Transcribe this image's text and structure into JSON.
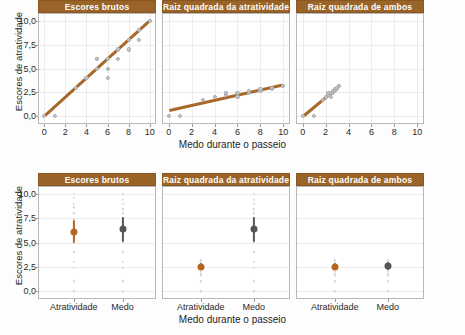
{
  "figure": {
    "y_axis_title": "Escores de atratividade",
    "x_axis_title_top": "Medo durante o passeio",
    "x_axis_title_bottom": "Medo durante o passeio",
    "strip_color": "#9a6328",
    "strip_text_color": "#ffffff",
    "fit_line_color": "#a8682a",
    "point_color": "#c9c9c9",
    "mean_attractiveness_color": "#b5651d",
    "mean_fear_color": "#555555"
  },
  "chart_data": [
    {
      "type": "scatter",
      "panel_index": 0,
      "row": "top",
      "title": "Escores brutos",
      "xlabel": "Medo durante o passeio",
      "ylabel": "Escores de atratividade",
      "xlim": [
        -0.5,
        10.5
      ],
      "ylim": [
        -0.7,
        10.7
      ],
      "xticks": [
        0,
        2,
        4,
        6,
        8,
        10
      ],
      "xticklabels": [
        "0",
        "2",
        "4",
        "6",
        "8",
        "10"
      ],
      "yticks": [
        0,
        2.5,
        5,
        7.5,
        10
      ],
      "yticklabels": [
        "0,0",
        "2,5",
        "5,0",
        "7,5",
        "10,0"
      ],
      "grid": true,
      "x": [
        0,
        1,
        3,
        4,
        5,
        5,
        5,
        6,
        6,
        6,
        6,
        7,
        7,
        7,
        8,
        8,
        8,
        9,
        9,
        9,
        10,
        10
      ],
      "y": [
        0,
        0,
        3,
        4,
        5,
        6,
        6,
        4,
        5,
        6,
        6,
        6,
        7,
        7,
        7,
        8,
        8,
        8,
        9,
        9,
        10,
        10
      ],
      "fit_line": {
        "x0": 0,
        "y0": 0,
        "x1": 10,
        "y1": 10
      }
    },
    {
      "type": "scatter",
      "panel_index": 1,
      "row": "top",
      "title": "Raiz quadrada da atratividade",
      "xlabel": "Medo durante o passeio",
      "ylabel": "Escores de atratividade",
      "xlim": [
        -0.5,
        10.5
      ],
      "ylim": [
        -0.7,
        10.7
      ],
      "xticks": [
        0,
        2,
        4,
        6,
        8,
        10
      ],
      "xticklabels": [
        "0",
        "2",
        "4",
        "6",
        "8",
        "10"
      ],
      "grid": true,
      "x": [
        0,
        1,
        3,
        4,
        5,
        5,
        5,
        6,
        6,
        7,
        7,
        8,
        8,
        9,
        9,
        10,
        10
      ],
      "y": [
        0,
        0,
        1.73,
        2.0,
        2.24,
        2.45,
        2.45,
        2.0,
        2.45,
        2.45,
        2.65,
        2.65,
        2.83,
        2.83,
        3.0,
        3.16,
        3.16
      ],
      "fit_line": {
        "x0": 0,
        "y0": 0.62,
        "x1": 10,
        "y1": 3.3
      }
    },
    {
      "type": "scatter",
      "panel_index": 2,
      "row": "top",
      "title": "Raiz quadrada de ambos",
      "xlabel": "Medo durante o passeio",
      "ylabel": "Escores de atratividade",
      "xlim": [
        -0.5,
        10.5
      ],
      "ylim": [
        -0.7,
        10.7
      ],
      "xticks": [
        0,
        2,
        4,
        6,
        8,
        10
      ],
      "xticklabels": [
        "0",
        "2",
        "4",
        "6",
        "8",
        "10"
      ],
      "grid": true,
      "x": [
        0,
        1,
        1.73,
        2.0,
        2.24,
        2.24,
        2.45,
        2.45,
        2.65,
        2.65,
        2.83,
        2.83,
        3.0,
        3.0,
        3.16,
        3.16
      ],
      "y": [
        0,
        0,
        1.73,
        2.0,
        2.24,
        2.45,
        2.0,
        2.45,
        2.45,
        2.65,
        2.65,
        2.83,
        2.83,
        3.0,
        3.16,
        3.16
      ],
      "fit_line": {
        "x0": 0,
        "y0": 0.05,
        "x1": 3.25,
        "y1": 3.3
      }
    },
    {
      "type": "scatter",
      "panel_index": 3,
      "row": "bottom",
      "title": "Escores brutos",
      "xlabel": "Medo durante o passeio",
      "ylabel": "Escores de atratividade",
      "ylim": [
        -0.7,
        10.7
      ],
      "yticks": [
        0,
        2.5,
        5,
        7.5,
        10
      ],
      "yticklabels": [
        "0,0",
        "2,5",
        "5,0",
        "7,5",
        "10,0"
      ],
      "categories": [
        "Atratividade",
        "Medo"
      ],
      "grid": true,
      "means": [
        6.1,
        6.35
      ],
      "err_low": [
        4.95,
        5.0
      ],
      "err_high": [
        7.3,
        7.6
      ],
      "jitter": {
        "Atratividade": [
          0.0,
          1.0,
          2.4,
          3.0,
          4.0,
          5.0,
          5.6,
          6.0,
          6.0,
          6.6,
          7.0,
          7.4,
          8.0,
          8.6,
          9.0,
          9.6,
          10.0
        ],
        "Medo": [
          0.0,
          1.0,
          2.4,
          3.0,
          4.0,
          5.0,
          5.6,
          6.0,
          6.4,
          7.0,
          7.4,
          8.0,
          8.4,
          9.0,
          9.4,
          10.0,
          10.0
        ]
      }
    },
    {
      "type": "scatter",
      "panel_index": 4,
      "row": "bottom",
      "title": "Raiz quadrada da atratividade",
      "xlabel": "Medo durante o passeio",
      "ylabel": "Escores de atratividade",
      "ylim": [
        -0.7,
        10.7
      ],
      "categories": [
        "Atratividade",
        "Medo"
      ],
      "grid": true,
      "means": [
        2.5,
        6.35
      ],
      "err_low": [
        2.15,
        5.0
      ],
      "err_high": [
        2.85,
        7.6
      ],
      "jitter": {
        "Atratividade": [
          0.0,
          1.0,
          1.55,
          1.73,
          2.0,
          2.24,
          2.45,
          2.45,
          2.65,
          2.83,
          3.0,
          3.16
        ],
        "Medo": [
          0.0,
          1.0,
          2.4,
          3.0,
          4.0,
          5.0,
          5.6,
          6.0,
          6.4,
          7.0,
          7.4,
          8.0,
          8.4,
          9.0,
          9.4,
          10.0
        ]
      }
    },
    {
      "type": "scatter",
      "panel_index": 5,
      "row": "bottom",
      "title": "Raiz quadrada de ambos",
      "xlabel": "Medo durante o passeio",
      "ylabel": "Escores de atratividade",
      "ylim": [
        -0.7,
        10.7
      ],
      "categories": [
        "Atratividade",
        "Medo"
      ],
      "grid": true,
      "means": [
        2.5,
        2.55
      ],
      "err_low": [
        2.15,
        2.15
      ],
      "err_high": [
        2.85,
        2.95
      ],
      "jitter": {
        "Atratividade": [
          0.0,
          1.0,
          1.55,
          1.73,
          2.0,
          2.24,
          2.45,
          2.45,
          2.65,
          2.83,
          3.0,
          3.16
        ],
        "Medo": [
          0.0,
          1.0,
          1.55,
          1.73,
          2.0,
          2.24,
          2.45,
          2.45,
          2.65,
          2.83,
          3.0,
          3.16
        ]
      }
    }
  ]
}
